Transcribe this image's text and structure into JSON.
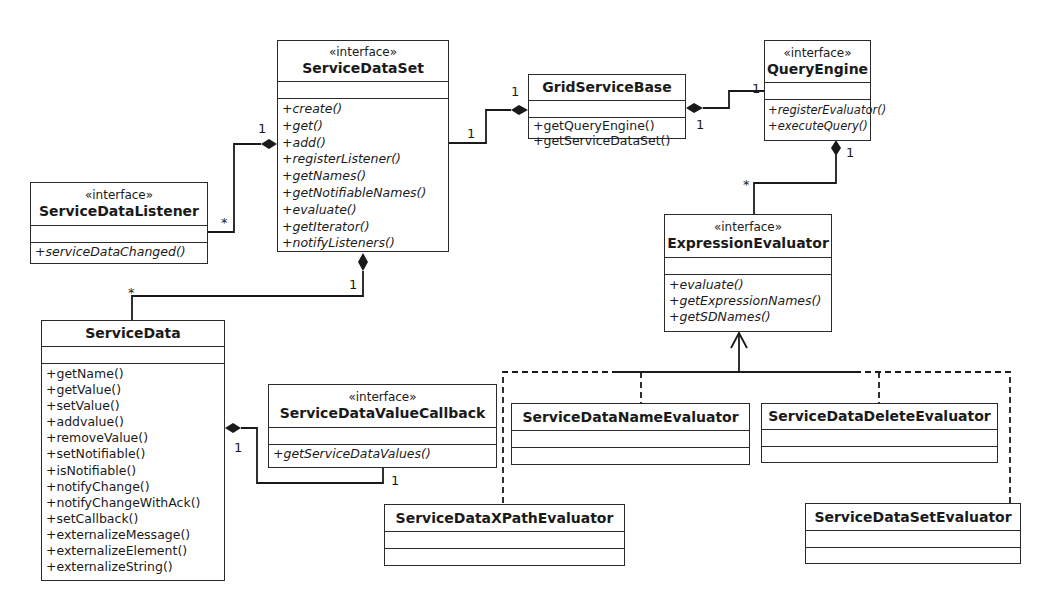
{
  "classes": {
    "service_data_set": {
      "stereotype": "«interface»",
      "name": "ServiceDataSet",
      "operations": [
        "+create()",
        "+get()",
        "+add()",
        "+registerListener()",
        "+getNames()",
        "+getNotifiableNames()",
        "+evaluate()",
        "+getIterator()",
        "+notifyListeners()"
      ]
    },
    "service_data_listener": {
      "stereotype": "«interface»",
      "name": "ServiceDataListener",
      "operations": [
        "+serviceDataChanged()"
      ]
    },
    "grid_service_base": {
      "name": "GridServiceBase",
      "operations": [
        "+getQueryEngine()",
        "+getServiceDataSet()"
      ]
    },
    "query_engine": {
      "stereotype": "«interface»",
      "name": "QueryEngine",
      "operations": [
        "+registerEvaluator()",
        "+executeQuery()"
      ]
    },
    "expression_evaluator": {
      "stereotype": "«interface»",
      "name": "ExpressionEvaluator",
      "operations": [
        "+evaluate()",
        "+getExpressionNames()",
        "+getSDNames()"
      ]
    },
    "service_data": {
      "name": "ServiceData",
      "operations": [
        "+getName()",
        "+getValue()",
        "+setValue()",
        "+addvalue()",
        "+removeValue()",
        "+setNotifiable()",
        "+isNotifiable()",
        "+notifyChange()",
        "+notifyChangeWithAck()",
        "+setCallback()",
        "+externalizeMessage()",
        "+externalizeElement()",
        "+externalizeString()"
      ]
    },
    "service_data_value_callback": {
      "stereotype": "«interface»",
      "name": "ServiceDataValueCallback",
      "operations": [
        "+getServiceDataValues()"
      ]
    },
    "service_data_name_evaluator": {
      "name": "ServiceDataNameEvaluator"
    },
    "service_data_delete_evaluator": {
      "name": "ServiceDataDeleteEvaluator"
    },
    "service_data_xpath_evaluator": {
      "name": "ServiceDataXPathEvaluator"
    },
    "service_data_set_evaluator": {
      "name": "ServiceDataSetEvaluator"
    }
  },
  "multiplicities": {
    "sds_listener_one": "1",
    "listener_many": "*",
    "sds_grid_one": "1",
    "grid_sds_one": "1",
    "grid_qe_one": "1",
    "qe_grid_one": "1",
    "qe_ee_one": "1",
    "ee_many": "*",
    "sds_sd_one": "1",
    "sd_many": "*",
    "sd_callback_one": "1",
    "callback_one": "1"
  },
  "colors": {
    "line": "#1a1a1a",
    "background": "#ffffff"
  }
}
